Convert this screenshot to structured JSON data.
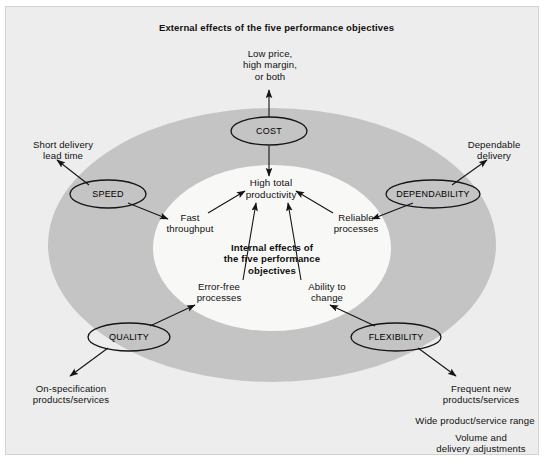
{
  "figure": {
    "title": "External effects of the five performance objectives",
    "center_caption": "Internal effects of\nthe five performance\nobjectives",
    "hub": "High total\nproductivity",
    "colors": {
      "background": "#ededed",
      "outer_ellipse": "#c4c4c4",
      "inner_ellipse": "#f7f7f5",
      "stroke": "#1a1a1a",
      "text": "#111111"
    }
  },
  "objectives": [
    {
      "id": "cost",
      "label": "COST",
      "external_effect": "Low price,\nhigh margin,\nor both",
      "internal_effect": ""
    },
    {
      "id": "speed",
      "label": "SPEED",
      "external_effect": "Short delivery\nlead time",
      "internal_effect": "Fast\nthroughput"
    },
    {
      "id": "dependability",
      "label": "DEPENDABILITY",
      "external_effect": "Dependable\ndelivery",
      "internal_effect": "Reliable\nprocesses"
    },
    {
      "id": "quality",
      "label": "QUALITY",
      "external_effect": "On-specification\nproducts/services",
      "internal_effect": "Error-free\nprocesses"
    },
    {
      "id": "flexibility",
      "label": "FLEXIBILITY",
      "external_effect": "Frequent new\nproducts/services",
      "external_effect_2": "Wide product/service range",
      "external_effect_3": "Volume and\ndelivery adjustments",
      "internal_effect": "Ability to\nchange"
    }
  ]
}
